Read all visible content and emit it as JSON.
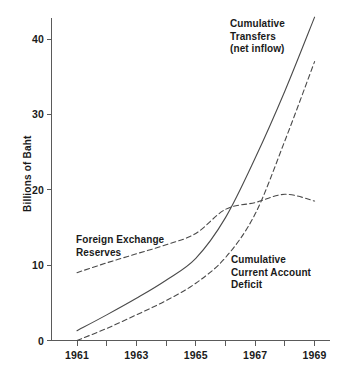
{
  "chart_data": {
    "type": "line",
    "title": "",
    "subtitle": "",
    "xlabel": "",
    "ylabel": "Billions of Baht",
    "xlim": [
      1960.5,
      1969.3
    ],
    "ylim": [
      0,
      44
    ],
    "grid": false,
    "legend_position": "inline-annotations",
    "x_tick_labels": [
      "1961",
      "1963",
      "1965",
      "1967",
      "1969"
    ],
    "x_tick_values": [
      1961,
      1963,
      1965,
      1967,
      1969
    ],
    "x_minor_tick_values": [
      1962,
      1964,
      1966,
      1968
    ],
    "y_tick_labels": [
      "0",
      "10",
      "20",
      "30",
      "40"
    ],
    "y_tick_values": [
      0,
      10,
      20,
      30,
      40
    ],
    "x": [
      1961,
      1962,
      1963,
      1964,
      1965,
      1966,
      1967,
      1968,
      1969
    ],
    "series": [
      {
        "name": "Cumulative Transfers (net inflow)",
        "style": "solid",
        "color": "#4a4a4a",
        "values": [
          1.3,
          3.4,
          5.6,
          8.0,
          10.9,
          16.3,
          24.2,
          33.1,
          42.9
        ]
      },
      {
        "name": "Foreign Exchange Reserves",
        "style": "dashed",
        "color": "#4a4a4a",
        "values": [
          9.0,
          10.3,
          11.5,
          12.7,
          14.2,
          17.4,
          18.3,
          19.4,
          18.5
        ]
      },
      {
        "name": "Cumulative Current Account Deficit",
        "style": "dashed",
        "color": "#4a4a4a",
        "values": [
          0.0,
          1.6,
          3.4,
          5.3,
          7.6,
          11.0,
          16.8,
          26.5,
          37.0
        ]
      }
    ],
    "annotations": [
      {
        "id": "transfers",
        "lines": [
          "Cumulative",
          "Transfers",
          "(net inflow)"
        ],
        "x": 230,
        "y": 18
      },
      {
        "id": "reserves",
        "lines": [
          "Foreign Exchange",
          "Reserves"
        ],
        "x": 76,
        "y": 234
      },
      {
        "id": "deficit",
        "lines": [
          "Cumulative",
          "Current Account",
          "Deficit"
        ],
        "x": 231,
        "y": 254
      }
    ]
  },
  "axis": {
    "y_label": "Billions of Baht",
    "y_ticks": [
      {
        "label": "40",
        "value": 40
      },
      {
        "label": "30",
        "value": 30
      },
      {
        "label": "20",
        "value": 20
      },
      {
        "label": "10",
        "value": 10
      },
      {
        "label": "0",
        "value": 0
      }
    ],
    "x_ticks": [
      {
        "label": "1961",
        "value": 1961
      },
      {
        "label": "1963",
        "value": 1963
      },
      {
        "label": "1965",
        "value": 1965
      },
      {
        "label": "1967",
        "value": 1967
      },
      {
        "label": "1969",
        "value": 1969
      }
    ]
  },
  "labels": {
    "transfers_l1": "Cumulative",
    "transfers_l2": "Transfers",
    "transfers_l3": "(net inflow)",
    "reserves_l1": "Foreign Exchange",
    "reserves_l2": "Reserves",
    "deficit_l1": "Cumulative",
    "deficit_l2": "Current Account",
    "deficit_l3": "Deficit"
  },
  "colors": {
    "line": "#4a4a4a",
    "axis": "#5a5a5a",
    "text": "#1a1a1a",
    "background": "#ffffff"
  }
}
